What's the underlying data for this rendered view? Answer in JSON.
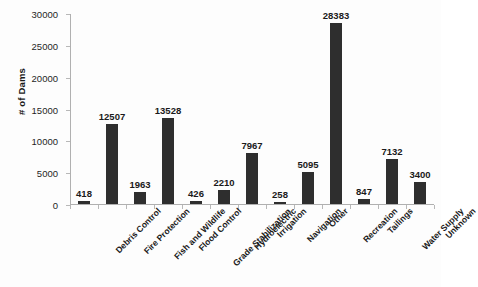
{
  "chart_data": {
    "type": "bar",
    "title": "",
    "xlabel": "",
    "ylabel": "# of Dams",
    "ylim": [
      0,
      30000
    ],
    "ytick_step": 5000,
    "ytick_labels": [
      "0",
      "5000",
      "10000",
      "15000",
      "20000",
      "25000",
      "30000"
    ],
    "grid": false,
    "legend": false,
    "bar_color": "#2e2e2e",
    "axis_color": "#b0b0b0",
    "categories": [
      "Debris Control",
      "Fire Protection",
      "Fish and Wildlife",
      "Flood Control",
      "Grade Stabilization",
      "Hydroelectric",
      "Irrigation",
      "Navigation",
      "Other",
      "Recreation",
      "Tailings",
      "Water Supply",
      "Unknown"
    ],
    "values": [
      418,
      12507,
      1963,
      13528,
      426,
      2210,
      7967,
      258,
      5095,
      28383,
      847,
      7132,
      3400
    ],
    "value_labels": [
      "418",
      "12507",
      "1963",
      "13528",
      "426",
      "2210",
      "7967",
      "258",
      "5095",
      "28383",
      "847",
      "7132",
      "3400"
    ]
  }
}
